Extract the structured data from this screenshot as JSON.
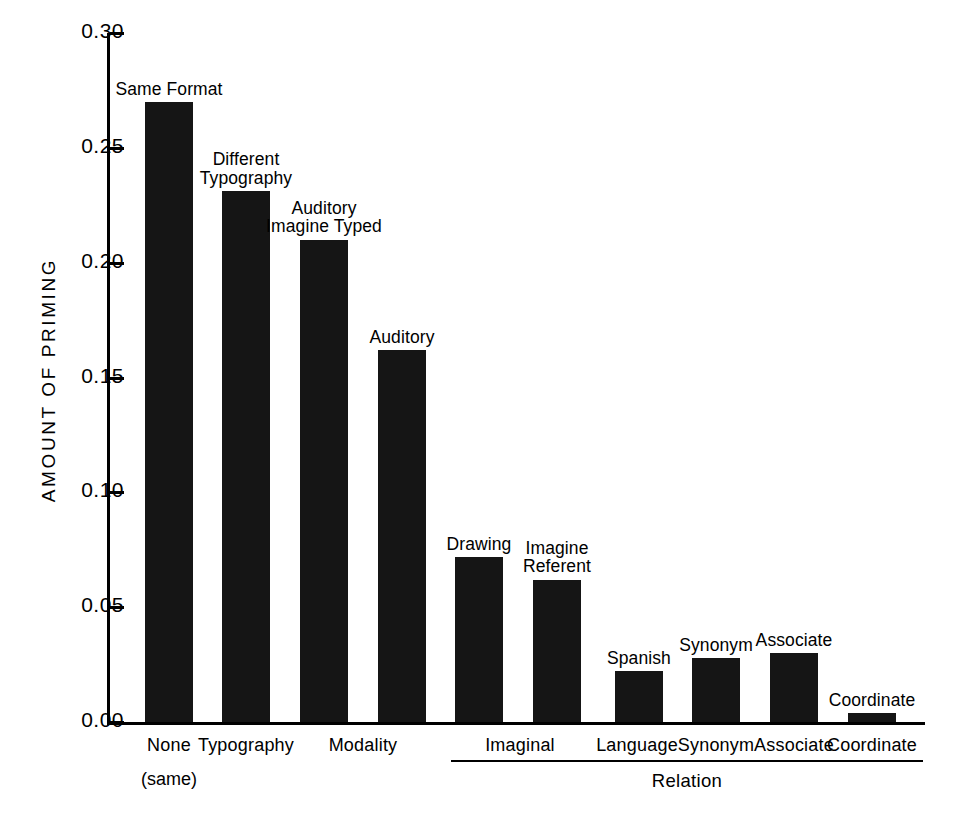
{
  "chart_data": {
    "type": "bar",
    "title": "",
    "xlabel": "Relation",
    "ylabel": "AMOUNT OF PRIMING",
    "ylim": [
      0.0,
      0.3
    ],
    "ytick_labels": [
      "0.30",
      "0.25",
      "0.20",
      "0.15",
      "0.10",
      "0.05",
      "0.00"
    ],
    "ytick_values": [
      0.3,
      0.25,
      0.2,
      0.15,
      0.1,
      0.05,
      0.0
    ],
    "grid": false,
    "legend": "none",
    "categories": [
      "Same Format",
      "Different Typography",
      "Auditory Imagine Typed",
      "Auditory",
      "Drawing",
      "Imagine Referent",
      "Spanish",
      "Synonym",
      "Associate",
      "Coordinate"
    ],
    "values": [
      0.27,
      0.231,
      0.21,
      0.162,
      0.072,
      0.062,
      0.022,
      0.028,
      0.03,
      0.004
    ],
    "bars": [
      {
        "label": "Same Format",
        "label_lines": "Same Format",
        "value": 0.27,
        "x": 145,
        "w": 48
      },
      {
        "label": "Different Typography",
        "label_lines": "Different\nTypography",
        "value": 0.231,
        "x": 222,
        "w": 48
      },
      {
        "label": "Auditory Imagine Typed",
        "label_lines": "Auditory\nImagine Typed",
        "value": 0.21,
        "x": 300,
        "w": 48
      },
      {
        "label": "Auditory",
        "label_lines": "Auditory",
        "value": 0.162,
        "x": 378,
        "w": 48
      },
      {
        "label": "Drawing",
        "label_lines": "Drawing",
        "value": 0.072,
        "x": 455,
        "w": 48
      },
      {
        "label": "Imagine Referent",
        "label_lines": "Imagine\nReferent",
        "value": 0.062,
        "x": 533,
        "w": 48
      },
      {
        "label": "Spanish",
        "label_lines": "Spanish",
        "value": 0.022,
        "x": 615,
        "w": 48
      },
      {
        "label": "Synonym",
        "label_lines": "Synonym",
        "value": 0.028,
        "x": 692,
        "w": 48
      },
      {
        "label": "Associate",
        "label_lines": "Associate",
        "value": 0.03,
        "x": 770,
        "w": 48
      },
      {
        "label": "Coordinate",
        "label_lines": "Coordinate",
        "value": 0.004,
        "x": 848,
        "w": 48
      }
    ],
    "x_tick_labels": [
      {
        "text": "None",
        "center": 169
      },
      {
        "text": "Typography",
        "center": 246
      },
      {
        "text": "Modality",
        "center": 363
      },
      {
        "text": "Imaginal",
        "center": 520
      },
      {
        "text": "Language",
        "center": 637
      },
      {
        "text": "Synonym",
        "center": 716
      },
      {
        "text": "Associate",
        "center": 794
      },
      {
        "text": "Coordinate",
        "center": 872
      }
    ],
    "x_sub_labels": [
      {
        "text": "(same)",
        "center": 169
      }
    ],
    "group_bracket": {
      "label": "Relation",
      "left": 451,
      "right": 923,
      "label_center": 687
    },
    "colors": {
      "bar_fill": "#151515",
      "axis": "#000000",
      "background": "#ffffff",
      "text": "#000000"
    }
  }
}
